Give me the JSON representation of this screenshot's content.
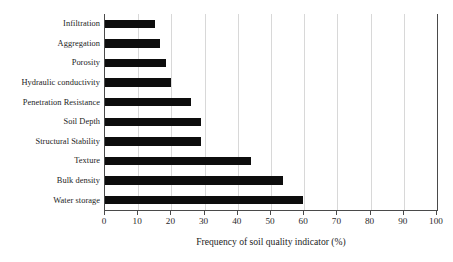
{
  "chart_data": {
    "type": "bar",
    "orientation": "horizontal",
    "title": "",
    "xlabel": "Frequency of soil quality indicator (%)",
    "ylabel": "",
    "xlim": [
      0,
      100
    ],
    "xticks": [
      0,
      10,
      20,
      30,
      40,
      50,
      60,
      70,
      80,
      90,
      100
    ],
    "xtick_labels": [
      "0",
      "10",
      "20",
      "30",
      "40",
      "50",
      "60",
      "70",
      "80",
      "90",
      "100"
    ],
    "grid": "vertical-only",
    "legend": "none",
    "bar_color": "#0d0d0d",
    "categories": [
      "Infiltration",
      "Aggregation",
      "Porosity",
      "Hydraulic conductivity",
      "Penetration Resistance",
      "Soil Depth",
      "Structural Stability",
      "Texture",
      "Bulk density",
      "Water storage"
    ],
    "values": [
      15,
      16.5,
      18.5,
      20,
      26,
      29,
      29,
      44,
      53.5,
      59.5
    ]
  },
  "axis": {
    "x_title": "Frequency of soil quality indicator (%)"
  }
}
